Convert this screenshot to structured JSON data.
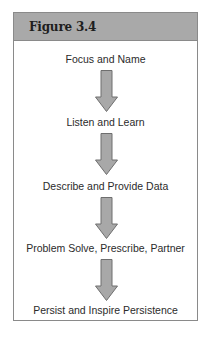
{
  "figure": {
    "title": "Figure 3.4",
    "header_color": "#a9a9a9",
    "arrow_fill": "#a8a8a8",
    "arrow_stroke": "#6e6e6e"
  },
  "steps": [
    {
      "label": "Focus and Name"
    },
    {
      "label": "Listen and Learn"
    },
    {
      "label": "Describe and Provide Data"
    },
    {
      "label": "Problem Solve, Prescribe, Partner"
    },
    {
      "label": "Persist and Inspire Persistence"
    }
  ],
  "arrows": [
    {
      "icon": "down-arrow-icon"
    },
    {
      "icon": "down-arrow-icon"
    },
    {
      "icon": "down-arrow-icon"
    },
    {
      "icon": "down-arrow-icon"
    }
  ]
}
